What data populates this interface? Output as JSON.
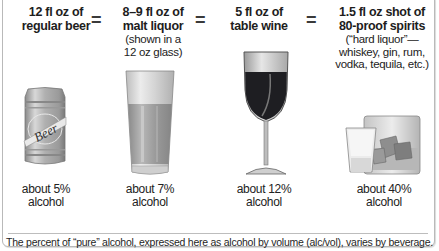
{
  "columns": [
    {
      "heading_line1": "12 fl oz of",
      "heading_line2": "regular beer",
      "note": [],
      "percent_line1": "about 5%",
      "percent_line2": "alcohol",
      "icon": "beer-can-icon",
      "can_label": "Beer"
    },
    {
      "heading_line1": "8–9 fl oz of",
      "heading_line2": "malt liquor",
      "note": [
        "(shown in a",
        "12 oz glass)"
      ],
      "percent_line1": "about 7%",
      "percent_line2": "alcohol",
      "icon": "pint-glass-icon"
    },
    {
      "heading_line1": "5 fl oz of",
      "heading_line2": "table wine",
      "note": [],
      "percent_line1": "about 12%",
      "percent_line2": "alcohol",
      "icon": "wine-glass-icon"
    },
    {
      "heading_line1": "1.5 fl oz shot of",
      "heading_line2": "80-proof spirits",
      "note": [
        "(“hard liquor”—",
        "whiskey, gin, rum,",
        "vodka, tequila, etc.)"
      ],
      "percent_line1": "about 40%",
      "percent_line2": "alcohol",
      "icon": "shot-and-rocks-glass-icon"
    }
  ],
  "equals_sign": "=",
  "footer": "The percent of “pure” alcohol, expressed here as alcohol by volume (alc/vol), varies by beverage.",
  "colors": {
    "wine": "#1e1e22",
    "liquid_gray": "#9a9a9a",
    "glass_gray": "#d6d6d6",
    "border": "#b9b9b9"
  }
}
